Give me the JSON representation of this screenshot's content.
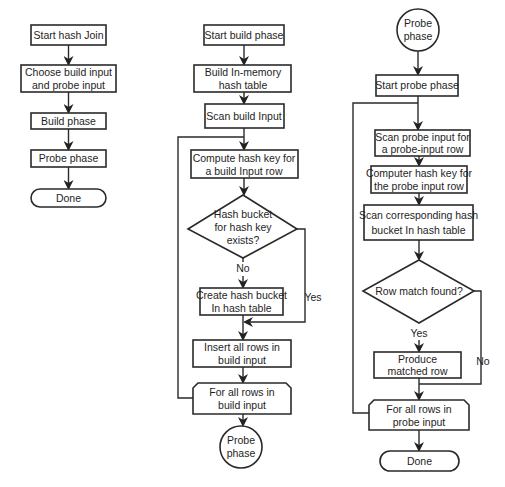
{
  "diagram": {
    "type": "flowchart",
    "flows": [
      {
        "name": "hash-join-overview",
        "nodes": [
          {
            "id": "start_hash_join",
            "shape": "rect",
            "lines": [
              "Start hash Join"
            ]
          },
          {
            "id": "choose_inputs",
            "shape": "rect",
            "lines": [
              "Choose build input",
              "and probe input"
            ]
          },
          {
            "id": "build_phase",
            "shape": "rect",
            "lines": [
              "Build phase"
            ]
          },
          {
            "id": "probe_phase",
            "shape": "rect",
            "lines": [
              "Probe phase"
            ]
          },
          {
            "id": "done",
            "shape": "terminator",
            "lines": [
              "Done"
            ]
          }
        ],
        "edges": [
          [
            "start_hash_join",
            "choose_inputs"
          ],
          [
            "choose_inputs",
            "build_phase"
          ],
          [
            "build_phase",
            "probe_phase"
          ],
          [
            "probe_phase",
            "done"
          ]
        ]
      },
      {
        "name": "build-phase",
        "nodes": [
          {
            "id": "start_build",
            "shape": "rect",
            "lines": [
              "Start build phase"
            ]
          },
          {
            "id": "build_table",
            "shape": "rect",
            "lines": [
              "Build In-memory",
              "hash table"
            ]
          },
          {
            "id": "scan_build",
            "shape": "rect",
            "lines": [
              "Scan build Input"
            ]
          },
          {
            "id": "compute_key",
            "shape": "rect",
            "lines": [
              "Compute hash key for",
              "a build Input row"
            ]
          },
          {
            "id": "bucket_exists",
            "shape": "diamond",
            "lines": [
              "Hash bucket",
              "for hash key",
              "exists?"
            ]
          },
          {
            "id": "create_bucket",
            "shape": "rect",
            "lines": [
              "Create hash bucket",
              "In hash table"
            ]
          },
          {
            "id": "insert_rows",
            "shape": "rect",
            "lines": [
              "Insert all rows in",
              "build input"
            ]
          },
          {
            "id": "loop_build",
            "shape": "loop-limit",
            "lines": [
              "For all rows in",
              "build input"
            ]
          },
          {
            "id": "to_probe",
            "shape": "connector",
            "lines": [
              "Probe",
              "phase"
            ]
          }
        ],
        "edge_labels": {
          "no": "No",
          "yes": "Yes"
        }
      },
      {
        "name": "probe-phase",
        "nodes": [
          {
            "id": "from_build",
            "shape": "connector",
            "lines": [
              "Probe",
              "phase"
            ]
          },
          {
            "id": "start_probe",
            "shape": "rect",
            "lines": [
              "Start probe phase"
            ]
          },
          {
            "id": "scan_probe",
            "shape": "rect",
            "lines": [
              "Scan probe input for",
              "a probe-input row"
            ]
          },
          {
            "id": "compute_probe_key",
            "shape": "rect",
            "lines": [
              "Computer hash key for",
              "the probe input row"
            ]
          },
          {
            "id": "scan_bucket",
            "shape": "rect",
            "lines": [
              "Scan corresponding hash",
              "bucket In hash table"
            ]
          },
          {
            "id": "row_match",
            "shape": "diamond",
            "lines": [
              "Row match found?"
            ]
          },
          {
            "id": "produce_row",
            "shape": "rect",
            "lines": [
              "Produce",
              "matched row"
            ]
          },
          {
            "id": "loop_probe",
            "shape": "loop-limit",
            "lines": [
              "For all rows in",
              "probe input"
            ]
          },
          {
            "id": "done_probe",
            "shape": "terminator",
            "lines": [
              "Done"
            ]
          }
        ],
        "edge_labels": {
          "yes": "Yes",
          "no": "No"
        }
      }
    ]
  }
}
